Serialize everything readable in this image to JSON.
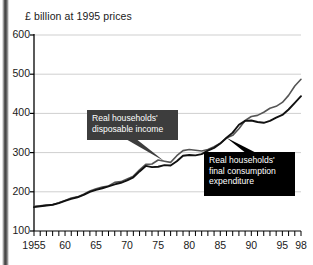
{
  "chart_data": {
    "type": "line",
    "title": "£ billion at 1995 prices",
    "xlabel": "",
    "ylabel": "",
    "ylim": [
      100,
      600
    ],
    "yticks": [
      100,
      200,
      300,
      400,
      500,
      600
    ],
    "ytick_labels": [
      "100",
      "200",
      "300",
      "400",
      "500",
      "600"
    ],
    "xlim": [
      1955,
      1998
    ],
    "xticks": [
      1955,
      1960,
      1965,
      1970,
      1975,
      1980,
      1985,
      1990,
      1995,
      1998
    ],
    "xtick_labels": [
      "1955",
      "60",
      "65",
      "70",
      "75",
      "80",
      "85",
      "90",
      "95",
      "98"
    ],
    "xtick_minor_step": 1,
    "grid": "horizontal",
    "legend": "annotated-callouts",
    "x": [
      1955,
      1956,
      1957,
      1958,
      1959,
      1960,
      1961,
      1962,
      1963,
      1964,
      1965,
      1966,
      1967,
      1968,
      1969,
      1970,
      1971,
      1972,
      1973,
      1974,
      1975,
      1976,
      1977,
      1978,
      1979,
      1980,
      1981,
      1982,
      1983,
      1984,
      1985,
      1986,
      1987,
      1988,
      1989,
      1990,
      1991,
      1992,
      1993,
      1994,
      1995,
      1996,
      1997,
      1998
    ],
    "series": [
      {
        "name": "Real households' disposable income",
        "color": "#555555",
        "values": [
          163,
          164,
          166,
          167,
          172,
          178,
          184,
          187,
          194,
          202,
          208,
          212,
          215,
          224,
          226,
          233,
          240,
          256,
          270,
          271,
          281,
          278,
          275,
          292,
          305,
          308,
          306,
          304,
          308,
          315,
          324,
          337,
          344,
          361,
          382,
          392,
          395,
          403,
          413,
          418,
          428,
          446,
          470,
          487
        ]
      },
      {
        "name": "Real households' final consumption expenditure",
        "color": "#111111",
        "values": [
          161,
          163,
          165,
          167,
          171,
          177,
          182,
          186,
          192,
          200,
          205,
          209,
          214,
          219,
          223,
          229,
          237,
          252,
          266,
          263,
          264,
          268,
          267,
          278,
          292,
          294,
          293,
          296,
          305,
          312,
          323,
          338,
          351,
          371,
          381,
          382,
          378,
          376,
          381,
          389,
          396,
          410,
          427,
          444
        ]
      }
    ],
    "annotations": [
      {
        "id": "income-callout",
        "lines": [
          "Real households'",
          "disposable income"
        ],
        "background": "#3d3d3d",
        "text_color": "#ffffff",
        "points_to_year": 1976
      },
      {
        "id": "expenditure-callout",
        "lines": [
          "Real households'",
          "final consumption",
          "expenditure"
        ],
        "background": "#000000",
        "text_color": "#ffffff",
        "points_to_year": 1986
      }
    ]
  },
  "axis": {
    "y_labels": [
      "600",
      "500",
      "400",
      "300",
      "200",
      "100"
    ],
    "x_labels": [
      "1955",
      "60",
      "65",
      "70",
      "75",
      "80",
      "85",
      "90",
      "95",
      "98"
    ]
  },
  "callouts": {
    "income": {
      "line1": "Real households'",
      "line2": "disposable income"
    },
    "expenditure": {
      "line1": "Real households'",
      "line2": "final consumption",
      "line3": "expenditure"
    }
  }
}
